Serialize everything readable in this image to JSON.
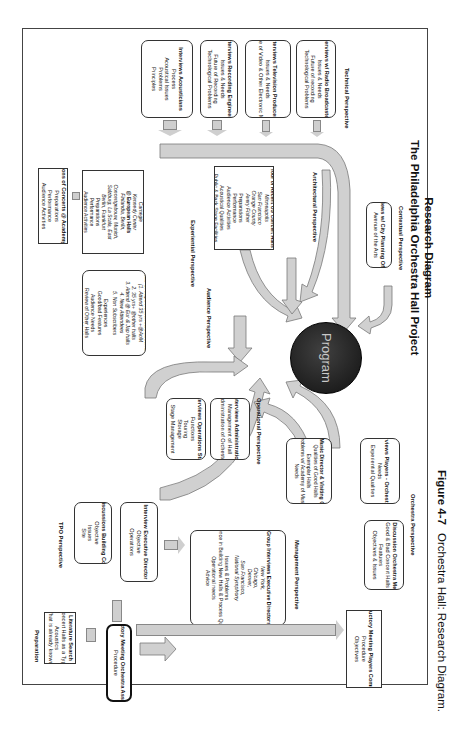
{
  "diagram": {
    "title_line1": "Research Diagram",
    "title_line2": "The Philadelphia Orchestra Hall Project",
    "center_node": "Program",
    "caption_label": "Figure 4-7",
    "caption_text": "Orchestra Hall: Research Diagram.",
    "perspectives": {
      "preparation": "Preparation",
      "tpo": "TPO Perspective",
      "management": "Management Perspective",
      "operational": "Operational Perspective",
      "orchestra": "Orchestra Perspective",
      "audience": "Audience Perspective",
      "experiential": "Experiential Perspective",
      "architectural": "Architectural Perspective",
      "contextual": "Contextual Perspective",
      "technical": "Technical Perspective"
    },
    "nodes": {
      "literature": {
        "title": "Literature Search",
        "lines": [
          "Concert Halls as a Type",
          "Acoustics",
          "What is already known?"
        ]
      },
      "intro_oa": {
        "title": "Introductory Meeting Orchestra Association",
        "lines": [
          "Procedure"
        ]
      },
      "intro_pc": {
        "title": "Introductory Meeting Players Committee",
        "lines": [
          "Procedure",
          "Objectives"
        ]
      },
      "building_comm": {
        "title": "Group Discussions Building Committee",
        "lines": [
          "Objective",
          "Issues",
          "Site"
        ]
      },
      "exec_dir": {
        "title": "Interview Executive Director",
        "lines": [
          "Objective",
          "Operations"
        ]
      },
      "group_exec": {
        "title": "Group Interviews Executive Directors",
        "italic": [
          "New York,",
          "Chicago,",
          "Denver,",
          "San Francisco,",
          "National Symphony"
        ],
        "lines": [
          "Issues & Problems",
          "Experience in Building New Halls & Process Questions",
          "Operational needs",
          "Advice"
        ]
      },
      "ops_staff": {
        "title": "Interviews Operations Staff",
        "lines": [
          "Functions",
          "Touring",
          "Storage",
          "Stage Management"
        ]
      },
      "admin": {
        "title": "Interviews Administration",
        "lines": [
          "Management of Hall",
          "Administration of Orchestra"
        ]
      },
      "music_dir": {
        "title": "Interviews Music Director & Visiting Conductors",
        "lines": [
          "Qualities of Good Halls",
          "Exemplar Halls",
          "Problems w/ Academy of Music",
          "Needs"
        ]
      },
      "players_sections": {
        "title": "Group Interviews Players - Orchestra Sections",
        "lines": [
          "Needs",
          "Experiential Qualities"
        ]
      },
      "orch_members": {
        "title": "Group Discussion Orchestra Members",
        "lines": [
          "Good & Bad Concert Halls",
          "Features",
          "Objectives & Issues"
        ]
      },
      "academy_obs": {
        "title": "Observations of Concerts @ Academy of Music",
        "lines": [
          "Preparations",
          "Performance",
          "Audience Activities"
        ]
      },
      "focus_groups": {
        "title": "Focus Groups Audience/Subscribers",
        "italic": [
          "(1. Attend 35 yrs +@AoM",
          "2. 35 yrs+ @other halls",
          "3. Attend @ Eur & Jap halls",
          "4. New Attendees",
          "5. Non Subscribers"
        ],
        "lines": [
          "Experiences",
          "Good/bad Features",
          "Audience Needs",
          "Review of Other Halls",
          "Importance of AoM"
        ]
      },
      "obs_halls": {
        "title": "Observation of Concerts",
        "sub1": "@ American Halls",
        "italic1": [
          "Carnegie",
          "Kennedy Center"
        ],
        "sub2": "@ European Halls",
        "italic2": [
          "Finlandia, Berlin,",
          "Concertgebouw, Munich,",
          "Salzburg, La Scala, East",
          "Berlin, Frankfurt"
        ],
        "lines": [
          "Preparations",
          "Performance",
          "Audience Activities",
          "Acoustical Qualities",
          "Public & Back Stage Facilities"
        ]
      },
      "tour_us": {
        "title": "Tour of Recent US Concert Halls",
        "italic": [
          "Minneapolis",
          "San Francisco",
          "Orange County",
          "Avery Fisher"
        ],
        "lines": [
          "Preparations",
          "Performance",
          "Audience Activities",
          "Acoustical Qualities",
          "Public & Back Stage Facilities"
        ]
      },
      "city_planning": {
        "title": "Interviews w/ City Planning Officials",
        "lines": [
          "Avenue of the Arts"
        ]
      },
      "acousticians": {
        "title": "Interviews Acousticians",
        "lines": [
          "Process",
          "Acoustical Issues",
          "Problems",
          "Principles"
        ]
      },
      "recording": {
        "title": "Interviews Recording Engineers",
        "lines": [
          "Issues & Needs",
          "Future of Recording",
          "Technological Problems"
        ]
      },
      "television": {
        "title": "Interviews Television Producers",
        "lines": [
          "Issues & Needs",
          "Future of Video & Other Electronic Media"
        ]
      },
      "radio": {
        "title": "Interviews w/ Radio Broadcasters",
        "lines": [
          "Issues & Needs",
          "Future of recording",
          "Technological Problems"
        ]
      }
    },
    "colors": {
      "arrow_fill": "#cfcfcf",
      "arrow_stroke": "#777777",
      "program_fill": "#151515",
      "program_text": "#cfcfcf",
      "frame": "#444444"
    }
  }
}
